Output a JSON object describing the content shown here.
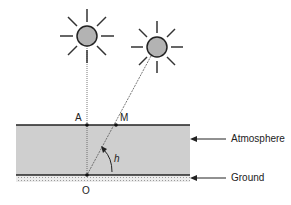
{
  "diagram": {
    "labels": {
      "point_a": "A",
      "point_m": "M",
      "point_o": "O",
      "angle": "h",
      "atmosphere": "Atmosphere",
      "ground": "Ground"
    },
    "elements": {
      "sun_zenith": "sun-icon (directly overhead)",
      "sun_oblique": "sun-icon (at elevation h)",
      "atmosphere_layer": "shaded band",
      "ground_layer": "hatched strip"
    },
    "colors": {
      "sun_fill": "#b3b3b3",
      "atmosphere_fill": "#cfcfcf",
      "ground_fill": "#e0e0e0",
      "line": "#222222"
    }
  }
}
